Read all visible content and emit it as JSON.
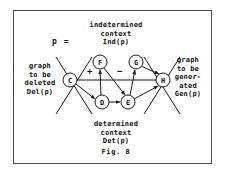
{
  "figure": {
    "caption": "Fig. 8",
    "production_symbol": "p ="
  },
  "annotations": {
    "top": "indetermined\ncontext\nInd(p)",
    "bottom": "determined\ncontext\nDet(p)",
    "left": "graph\nto be\ndeleted\nDel(p)",
    "right": "graph\nto be\ngener-\nated\nGen(p)"
  },
  "edge_signs": {
    "plus": "+",
    "minus": "−"
  },
  "colors": {
    "ink": "#111111",
    "frame": "#4a4a4a",
    "background": "#ffffff"
  },
  "graph_data": {
    "type": "node-link-diagram",
    "nodes": [
      {
        "id": "C",
        "label": "C",
        "cx": 70,
        "cy": 80,
        "r": 7
      },
      {
        "id": "F",
        "label": "F",
        "cx": 100,
        "cy": 62,
        "r": 7
      },
      {
        "id": "G",
        "label": "G",
        "cx": 136,
        "cy": 62,
        "r": 7
      },
      {
        "id": "D",
        "label": "D",
        "cx": 102,
        "cy": 102,
        "r": 7
      },
      {
        "id": "E",
        "label": "E",
        "cx": 128,
        "cy": 102,
        "r": 7
      },
      {
        "id": "H",
        "label": "H",
        "cx": 163,
        "cy": 80,
        "r": 7
      }
    ],
    "edges": [
      {
        "from": "C",
        "to": "D",
        "directed": true,
        "label": ""
      },
      {
        "from": "C",
        "to": "H",
        "directed": false,
        "label": ""
      },
      {
        "from": "D",
        "to": "F",
        "directed": true,
        "label": "+"
      },
      {
        "from": "D",
        "to": "E",
        "directed": true,
        "label": ""
      },
      {
        "from": "F",
        "to": "E",
        "directed": true,
        "label": "−"
      },
      {
        "from": "E",
        "to": "G",
        "directed": true,
        "label": ""
      },
      {
        "from": "G",
        "to": "H",
        "directed": true,
        "label": ""
      },
      {
        "from": "E",
        "to": "H",
        "directed": true,
        "label": ""
      }
    ],
    "cut_lines": [
      {
        "from_x": 56,
        "from_y": 58,
        "to_x": 90,
        "to_y": 112
      },
      {
        "from_x": 90,
        "from_y": 58,
        "to_x": 56,
        "to_y": 112
      },
      {
        "from_x": 146,
        "from_y": 58,
        "to_x": 180,
        "to_y": 112
      },
      {
        "from_x": 180,
        "from_y": 58,
        "to_x": 146,
        "to_y": 112
      }
    ]
  }
}
